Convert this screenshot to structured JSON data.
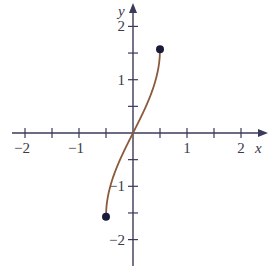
{
  "chart_data": {
    "type": "line",
    "title": "",
    "xlabel": "x",
    "ylabel": "y",
    "xlim": [
      -2.2,
      2.4
    ],
    "ylim": [
      -2.4,
      2.4
    ],
    "grid": false,
    "legend": null,
    "x_tick_labels": [
      "-2",
      "-1",
      "1",
      "2"
    ],
    "y_tick_labels": [
      "2",
      "1",
      "-1",
      "-2"
    ],
    "x_ticks": [
      -2,
      -1.5,
      -1,
      -0.5,
      0.5,
      1,
      1.5,
      2
    ],
    "y_ticks": [
      2,
      1.5,
      1,
      0.5,
      -0.5,
      -1,
      -1.5,
      -2
    ],
    "series": [
      {
        "name": "y = arcsin(2x)",
        "domain": [
          -0.5,
          0.5
        ],
        "x": [
          -0.5,
          -0.45,
          -0.4,
          -0.3,
          -0.2,
          -0.1,
          0,
          0.1,
          0.2,
          0.3,
          0.4,
          0.45,
          0.5
        ],
        "y": [
          -1.571,
          -1.12,
          -0.927,
          -0.644,
          -0.412,
          -0.201,
          0,
          0.201,
          0.412,
          0.644,
          0.927,
          1.12,
          1.571
        ],
        "color": "#8b5a3c"
      }
    ],
    "endpoints": [
      {
        "x": -0.5,
        "y": -1.571,
        "style": "closed"
      },
      {
        "x": 0.5,
        "y": 1.571,
        "style": "closed"
      }
    ]
  },
  "colors": {
    "axis": "#3a3a5a",
    "curve": "#8b5a3c",
    "point": "#1a1a3a"
  }
}
